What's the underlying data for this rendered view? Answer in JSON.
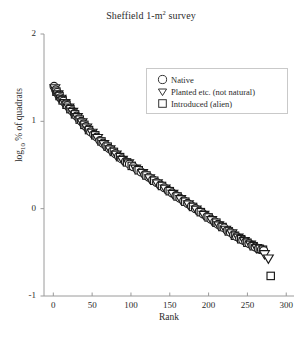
{
  "chart_data": {
    "type": "scatter",
    "title": "Sheffield 1-m2 survey",
    "title_main": "Sheffield 1-m",
    "title_sup": "2",
    "title_tail": " survey",
    "xlabel": "Rank",
    "ylabel_main": "log",
    "ylabel_sub": "10",
    "ylabel_tail": " % of quadrats",
    "ylabel": "log10 % of quadrats",
    "xlim": [
      -12,
      310
    ],
    "ylim": [
      -1,
      2
    ],
    "xticks": [
      0,
      50,
      100,
      150,
      200,
      250,
      300
    ],
    "xticklabels": [
      "0",
      "50",
      "100",
      "150",
      "200",
      "250",
      "300"
    ],
    "yticks": [
      -1,
      0,
      1,
      2
    ],
    "yticklabels": [
      "-1",
      "0",
      "1",
      "2"
    ],
    "grid": false,
    "legend_position": "upper right",
    "legend": [
      {
        "label": "Native",
        "marker": "circle"
      },
      {
        "label": "Planted etc. (not natural)",
        "marker": "triangle-down"
      },
      {
        "label": "Introduced (alien)",
        "marker": "square"
      }
    ],
    "marker_facecolor": "#ffffff",
    "marker_edgecolor": "#1a1a1a",
    "axis_color": "#9a9a9a",
    "series": [
      {
        "name": "Native",
        "marker": "circle",
        "points": [
          [
            1,
            1.4
          ],
          [
            3,
            1.36
          ],
          [
            5,
            1.33
          ],
          [
            7,
            1.3
          ],
          [
            9,
            1.27
          ],
          [
            11,
            1.25
          ],
          [
            13,
            1.23
          ],
          [
            16,
            1.2
          ],
          [
            18,
            1.18
          ],
          [
            21,
            1.15
          ],
          [
            24,
            1.12
          ],
          [
            27,
            1.09
          ],
          [
            30,
            1.06
          ],
          [
            33,
            1.03
          ],
          [
            36,
            1.0
          ],
          [
            39,
            0.97
          ],
          [
            42,
            0.94
          ],
          [
            45,
            0.91
          ],
          [
            48,
            0.88
          ],
          [
            52,
            0.85
          ],
          [
            56,
            0.82
          ],
          [
            60,
            0.78
          ],
          [
            64,
            0.75
          ],
          [
            68,
            0.72
          ],
          [
            72,
            0.69
          ],
          [
            76,
            0.66
          ],
          [
            80,
            0.63
          ],
          [
            84,
            0.6
          ],
          [
            88,
            0.57
          ],
          [
            93,
            0.54
          ],
          [
            98,
            0.51
          ],
          [
            103,
            0.48
          ],
          [
            108,
            0.45
          ],
          [
            113,
            0.42
          ],
          [
            118,
            0.39
          ],
          [
            123,
            0.36
          ],
          [
            128,
            0.33
          ],
          [
            133,
            0.3
          ],
          [
            138,
            0.27
          ],
          [
            143,
            0.24
          ],
          [
            148,
            0.21
          ],
          [
            153,
            0.18
          ],
          [
            158,
            0.15
          ],
          [
            163,
            0.12
          ],
          [
            168,
            0.09
          ],
          [
            173,
            0.06
          ],
          [
            178,
            0.03
          ],
          [
            183,
            0.0
          ],
          [
            188,
            -0.03
          ],
          [
            193,
            -0.06
          ],
          [
            198,
            -0.09
          ],
          [
            203,
            -0.12
          ],
          [
            208,
            -0.15
          ],
          [
            212,
            -0.18
          ],
          [
            216,
            -0.2
          ],
          [
            220,
            -0.22
          ],
          [
            224,
            -0.25
          ],
          [
            228,
            -0.27
          ],
          [
            232,
            -0.3
          ],
          [
            236,
            -0.32
          ],
          [
            240,
            -0.34
          ],
          [
            244,
            -0.36
          ],
          [
            248,
            -0.38
          ],
          [
            252,
            -0.4
          ],
          [
            256,
            -0.42
          ],
          [
            260,
            -0.44
          ],
          [
            264,
            -0.46
          ],
          [
            268,
            -0.47
          ],
          [
            271,
            -0.48
          ]
        ]
      },
      {
        "name": "Planted etc. (not natural)",
        "marker": "triangle-down",
        "points": [
          [
            2,
            1.38
          ],
          [
            6,
            1.31
          ],
          [
            10,
            1.26
          ],
          [
            15,
            1.21
          ],
          [
            20,
            1.16
          ],
          [
            25,
            1.11
          ],
          [
            31,
            1.05
          ],
          [
            37,
            0.99
          ],
          [
            43,
            0.93
          ],
          [
            50,
            0.87
          ],
          [
            57,
            0.81
          ],
          [
            65,
            0.74
          ],
          [
            73,
            0.68
          ],
          [
            81,
            0.62
          ],
          [
            89,
            0.56
          ],
          [
            97,
            0.52
          ],
          [
            106,
            0.46
          ],
          [
            115,
            0.41
          ],
          [
            124,
            0.35
          ],
          [
            134,
            0.29
          ],
          [
            144,
            0.23
          ],
          [
            154,
            0.17
          ],
          [
            164,
            0.11
          ],
          [
            174,
            0.05
          ],
          [
            184,
            -0.01
          ],
          [
            194,
            -0.07
          ],
          [
            204,
            -0.13
          ],
          [
            213,
            -0.19
          ],
          [
            222,
            -0.24
          ],
          [
            230,
            -0.28
          ],
          [
            238,
            -0.33
          ],
          [
            246,
            -0.37
          ],
          [
            254,
            -0.41
          ],
          [
            262,
            -0.45
          ],
          [
            272,
            -0.52
          ],
          [
            277,
            -0.57
          ]
        ]
      },
      {
        "name": "Introduced (alien)",
        "marker": "square",
        "points": [
          [
            4,
            1.34
          ],
          [
            8,
            1.29
          ],
          [
            12,
            1.24
          ],
          [
            17,
            1.19
          ],
          [
            22,
            1.14
          ],
          [
            28,
            1.08
          ],
          [
            34,
            1.02
          ],
          [
            40,
            0.96
          ],
          [
            46,
            0.9
          ],
          [
            54,
            0.84
          ],
          [
            62,
            0.77
          ],
          [
            70,
            0.71
          ],
          [
            78,
            0.65
          ],
          [
            86,
            0.59
          ],
          [
            95,
            0.53
          ],
          [
            101,
            0.49
          ],
          [
            110,
            0.44
          ],
          [
            120,
            0.38
          ],
          [
            130,
            0.32
          ],
          [
            140,
            0.26
          ],
          [
            150,
            0.2
          ],
          [
            160,
            0.14
          ],
          [
            170,
            0.08
          ],
          [
            180,
            0.02
          ],
          [
            190,
            -0.04
          ],
          [
            200,
            -0.1
          ],
          [
            210,
            -0.16
          ],
          [
            218,
            -0.21
          ],
          [
            226,
            -0.26
          ],
          [
            234,
            -0.31
          ],
          [
            242,
            -0.35
          ],
          [
            250,
            -0.39
          ],
          [
            258,
            -0.43
          ],
          [
            266,
            -0.46
          ],
          [
            270,
            -0.47
          ],
          [
            280,
            -0.77
          ]
        ]
      }
    ]
  }
}
